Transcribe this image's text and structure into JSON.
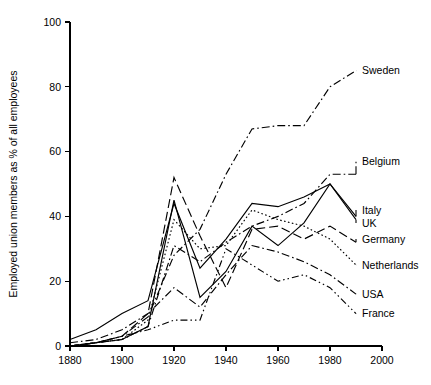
{
  "chart_data": {
    "type": "line",
    "title": "",
    "subtitle": "",
    "xlabel": "",
    "ylabel": "Employed union members as % of all employees",
    "xlim": [
      1880,
      2000
    ],
    "ylim": [
      0,
      100
    ],
    "xticks": [
      1880,
      1900,
      1920,
      1940,
      1960,
      1980,
      2000
    ],
    "yticks": [
      0,
      20,
      40,
      60,
      80,
      100
    ],
    "grid": false,
    "legend_position": "right-inline-labels",
    "series": [
      {
        "name": "Sweden",
        "dash": "dash-dot",
        "label_x": 1990,
        "label_y": 85,
        "x": [
          1880,
          1890,
          1900,
          1910,
          1920,
          1930,
          1940,
          1950,
          1960,
          1970,
          1980,
          1990
        ],
        "values": [
          0,
          1,
          3,
          9,
          28,
          36,
          53,
          67,
          68,
          68,
          80,
          85
        ]
      },
      {
        "name": "Belgium",
        "dash": "dash-dot",
        "label_x": 1990,
        "label_y": 57,
        "x": [
          1880,
          1890,
          1900,
          1910,
          1920,
          1930,
          1940,
          1950,
          1960,
          1970,
          1980,
          1990
        ],
        "values": [
          0,
          1,
          2,
          6,
          31,
          26,
          32,
          37,
          40,
          44,
          53,
          53
        ]
      },
      {
        "name": "Italy",
        "dash": "solid",
        "label_x": 1990,
        "label_y": 42,
        "x": [
          1880,
          1890,
          1900,
          1910,
          1920,
          1930,
          1940,
          1950,
          1960,
          1970,
          1980,
          1990
        ],
        "values": [
          0,
          1,
          2,
          6,
          45,
          15,
          23,
          37,
          31,
          38,
          50,
          40
        ]
      },
      {
        "name": "UK",
        "dash": "solid",
        "label_x": 1990,
        "label_y": 38,
        "x": [
          1880,
          1890,
          1900,
          1910,
          1920,
          1930,
          1940,
          1950,
          1960,
          1970,
          1980,
          1990
        ],
        "values": [
          2,
          5,
          10,
          14,
          44,
          24,
          33,
          44,
          43,
          46,
          50,
          39
        ]
      },
      {
        "name": "Germany",
        "dash": "long-dash",
        "label_x": 1990,
        "label_y": 33,
        "x": [
          1880,
          1890,
          1900,
          1910,
          1920,
          1930,
          1940,
          1950,
          1960,
          1970,
          1980,
          1990
        ],
        "values": [
          0,
          1,
          3,
          10,
          52,
          34,
          18,
          36,
          37,
          33,
          37,
          32
        ]
      },
      {
        "name": "Netherlands",
        "dash": "dotted",
        "label_x": 1990,
        "label_y": 25,
        "x": [
          1880,
          1890,
          1900,
          1910,
          1920,
          1930,
          1940,
          1950,
          1960,
          1970,
          1980,
          1990
        ],
        "values": [
          0,
          1,
          2,
          8,
          39,
          30,
          31,
          42,
          39,
          37,
          33,
          25
        ]
      },
      {
        "name": "USA",
        "dash": "dash-dot",
        "label_x": 1990,
        "label_y": 16,
        "x": [
          1880,
          1890,
          1900,
          1910,
          1920,
          1930,
          1940,
          1950,
          1960,
          1970,
          1980,
          1990
        ],
        "values": [
          1,
          2,
          5,
          10,
          18,
          12,
          22,
          31,
          29,
          26,
          22,
          16
        ]
      },
      {
        "name": "France",
        "dash": "dash-dot-dot",
        "label_x": 1990,
        "label_y": 10,
        "x": [
          1880,
          1890,
          1900,
          1910,
          1920,
          1930,
          1940,
          1950,
          1960,
          1970,
          1980,
          1990
        ],
        "values": [
          0,
          1,
          3,
          5,
          8,
          8,
          30,
          25,
          20,
          22,
          18,
          10
        ]
      }
    ]
  },
  "axes": {
    "y_title": "Employed union members as % of all employees",
    "y_tick_labels": [
      "0",
      "20",
      "40",
      "60",
      "80",
      "100"
    ],
    "x_tick_labels": [
      "1880",
      "1900",
      "1920",
      "1940",
      "1960",
      "1980",
      "2000"
    ]
  },
  "labels": {
    "sweden": "Sweden",
    "belgium": "Belgium",
    "italy": "Italy",
    "uk": "UK",
    "germany": "Germany",
    "netherlands": "Netherlands",
    "usa": "USA",
    "france": "France"
  }
}
